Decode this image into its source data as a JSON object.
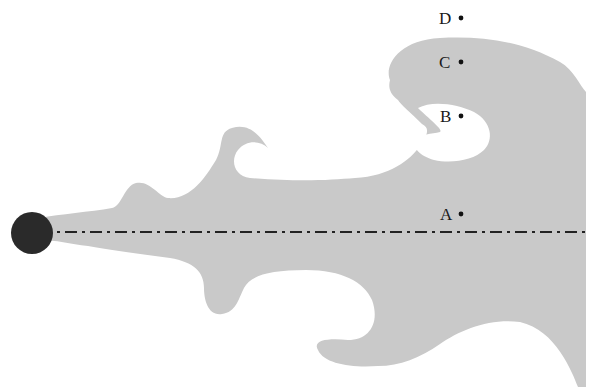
{
  "figure": {
    "shape_color": "#c9c9c9",
    "ball_color": "#2a2a2a",
    "axis_color": "#222222",
    "points": [
      {
        "label": "D",
        "x": 461,
        "y": 18
      },
      {
        "label": "C",
        "x": 461,
        "y": 62
      },
      {
        "label": "B",
        "x": 461,
        "y": 116
      },
      {
        "label": "A",
        "x": 461,
        "y": 214
      }
    ]
  }
}
